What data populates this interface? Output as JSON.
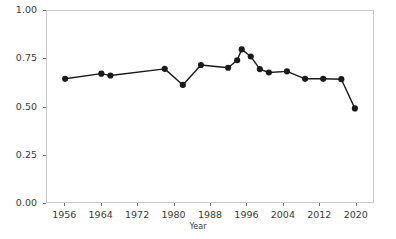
{
  "chart_data": {
    "type": "line",
    "title": "",
    "xlabel": "Year",
    "ylabel": "",
    "xlim": [
      1952,
      2024
    ],
    "ylim": [
      0.0,
      1.0
    ],
    "grid": false,
    "legend": false,
    "marker": "filled-circle",
    "line_color": "#1a1a1a",
    "marker_color": "#1a1a1a",
    "panel_border_color": "#c8c8c8",
    "background_color": "#ffffff",
    "xticks": [
      1956,
      1964,
      1972,
      1980,
      1988,
      1996,
      2004,
      2012,
      2020
    ],
    "xticklabels": [
      "1956",
      "1964",
      "1972",
      "1980",
      "1988",
      "1996",
      "2004",
      "2012",
      "2020"
    ],
    "yticks": [
      0.0,
      0.25,
      0.5,
      0.75,
      1.0
    ],
    "yticklabels": [
      "0.00",
      "0.25",
      "0.50",
      "0.75",
      "1.00"
    ],
    "x": [
      1956,
      1964,
      1966,
      1978,
      1982,
      1986,
      1992,
      1994,
      1995,
      1997,
      1999,
      2001,
      2005,
      2009,
      2013,
      2017,
      2020
    ],
    "y": [
      0.645,
      0.672,
      0.662,
      0.697,
      0.613,
      0.717,
      0.703,
      0.742,
      0.799,
      0.762,
      0.696,
      0.678,
      0.684,
      0.645,
      0.645,
      0.643,
      0.49
    ],
    "series": [
      {
        "name": "value",
        "points": [
          {
            "x": 1956,
            "y": 0.645
          },
          {
            "x": 1964,
            "y": 0.672
          },
          {
            "x": 1966,
            "y": 0.662
          },
          {
            "x": 1978,
            "y": 0.697
          },
          {
            "x": 1982,
            "y": 0.613
          },
          {
            "x": 1986,
            "y": 0.717
          },
          {
            "x": 1992,
            "y": 0.703
          },
          {
            "x": 1994,
            "y": 0.742
          },
          {
            "x": 1995,
            "y": 0.799
          },
          {
            "x": 1997,
            "y": 0.762
          },
          {
            "x": 1999,
            "y": 0.696
          },
          {
            "x": 2001,
            "y": 0.678
          },
          {
            "x": 2005,
            "y": 0.684
          },
          {
            "x": 2009,
            "y": 0.645
          },
          {
            "x": 2013,
            "y": 0.645
          },
          {
            "x": 2017,
            "y": 0.643
          },
          {
            "x": 2020,
            "y": 0.49
          }
        ]
      }
    ]
  }
}
